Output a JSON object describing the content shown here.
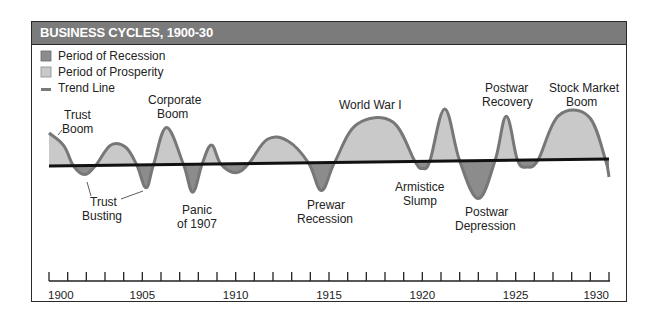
{
  "chart_data": {
    "type": "area",
    "title": "BUSINESS CYCLES, 1900-30",
    "xlabel": "",
    "ylabel": "",
    "x_range": [
      1900,
      1930
    ],
    "grid": false,
    "legend": [
      {
        "label": "Period of Recession",
        "swatch": "square",
        "color": "#8c8c8c"
      },
      {
        "label": "Period of Prosperity",
        "swatch": "square",
        "color": "#c9c9c9"
      },
      {
        "label": "Trend Line",
        "swatch": "dash",
        "color": "#7a7a7a"
      }
    ],
    "tick_labels": [
      "1900",
      "1905",
      "1910",
      "1915",
      "1920",
      "1925",
      "1930"
    ],
    "major_ticks": [
      1900,
      1905,
      1910,
      1915,
      1920,
      1925,
      1930
    ],
    "minor_tick_step": 1,
    "colors": {
      "prosperity": "#c9c9c9",
      "recession": "#8c8c8c",
      "curve": "#777777",
      "trend": "#111111",
      "header_bg": "#7b7b7b"
    },
    "trend_line": {
      "start_year": 1900,
      "end_year": 1930,
      "start_offset": 0,
      "end_offset": 0
    },
    "curve_points_relative": [
      {
        "year": 1900.0,
        "value": 33
      },
      {
        "year": 1900.8,
        "value": 20
      },
      {
        "year": 1901.3,
        "value": 0
      },
      {
        "year": 1901.9,
        "value": -9
      },
      {
        "year": 1902.5,
        "value": 0
      },
      {
        "year": 1903.3,
        "value": 20
      },
      {
        "year": 1904.1,
        "value": 18
      },
      {
        "year": 1904.7,
        "value": 0
      },
      {
        "year": 1905.2,
        "value": -23
      },
      {
        "year": 1905.6,
        "value": 0
      },
      {
        "year": 1906.3,
        "value": 37
      },
      {
        "year": 1907.2,
        "value": 0
      },
      {
        "year": 1907.7,
        "value": -28
      },
      {
        "year": 1908.2,
        "value": 0
      },
      {
        "year": 1908.7,
        "value": 19
      },
      {
        "year": 1909.2,
        "value": 0
      },
      {
        "year": 1910.0,
        "value": -9
      },
      {
        "year": 1910.7,
        "value": 0
      },
      {
        "year": 1911.7,
        "value": 24
      },
      {
        "year": 1912.8,
        "value": 22
      },
      {
        "year": 1913.9,
        "value": 0
      },
      {
        "year": 1914.6,
        "value": -28
      },
      {
        "year": 1915.3,
        "value": 0
      },
      {
        "year": 1916.5,
        "value": 38
      },
      {
        "year": 1918.4,
        "value": 40
      },
      {
        "year": 1919.6,
        "value": 0
      },
      {
        "year": 1920.0,
        "value": -7
      },
      {
        "year": 1920.4,
        "value": 0
      },
      {
        "year": 1921.2,
        "value": 52
      },
      {
        "year": 1922.0,
        "value": 0
      },
      {
        "year": 1923.0,
        "value": -38
      },
      {
        "year": 1923.9,
        "value": 0
      },
      {
        "year": 1924.5,
        "value": 44
      },
      {
        "year": 1925.1,
        "value": 0
      },
      {
        "year": 1925.6,
        "value": -7
      },
      {
        "year": 1926.2,
        "value": 0
      },
      {
        "year": 1927.3,
        "value": 44
      },
      {
        "year": 1928.9,
        "value": 43
      },
      {
        "year": 1929.8,
        "value": 0
      },
      {
        "year": 1930.0,
        "value": -18
      }
    ],
    "annotations": [
      {
        "label": "Trust Boom",
        "year": 1900
      },
      {
        "label": "Trust Busting",
        "year": 1902
      },
      {
        "label": "Corporate Boom",
        "year": 1906
      },
      {
        "label": "Panic of 1907",
        "year": 1907.7
      },
      {
        "label": "Prewar Recession",
        "year": 1914.6
      },
      {
        "label": "World War I",
        "year": 1918
      },
      {
        "label": "Armistice Slump",
        "year": 1920
      },
      {
        "label": "Postwar Depression",
        "year": 1923
      },
      {
        "label": "Postwar Recovery",
        "year": 1924.5
      },
      {
        "label": "Stock Market Boom",
        "year": 1928
      }
    ]
  },
  "header": {
    "title": "BUSINESS CYCLES, 1900-30"
  },
  "legend": {
    "recession": "Period of Recession",
    "prosperity": "Period of Prosperity",
    "trend": "Trend Line"
  },
  "labels": {
    "trust_boom": [
      "Trust",
      "Boom"
    ],
    "trust_busting": [
      "Trust",
      "Busting"
    ],
    "corporate_boom": [
      "Corporate",
      "Boom"
    ],
    "panic_1907": [
      "Panic",
      "of 1907"
    ],
    "prewar_recession": [
      "Prewar",
      "Recession"
    ],
    "world_war_i": [
      "World War I"
    ],
    "armistice_slump": [
      "Armistice",
      "Slump"
    ],
    "postwar_depression": [
      "Postwar",
      "Depression"
    ],
    "postwar_recovery": [
      "Postwar",
      "Recovery"
    ],
    "stock_market_boom": [
      "Stock Market",
      "Boom"
    ]
  },
  "axis": {
    "ticks": [
      "1900",
      "1905",
      "1910",
      "1915",
      "1920",
      "1925",
      "1930"
    ]
  }
}
